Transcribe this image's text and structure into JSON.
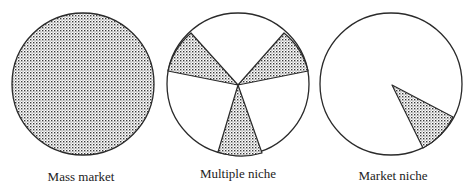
{
  "colors": {
    "outline": "#2a2a2a",
    "stipple_dot": "#3a3a3a",
    "background": "#ffffff"
  },
  "diagrams": [
    {
      "id": "mass-market",
      "label": "Mass market",
      "description": "Entire circle shaded: the whole market is targeted",
      "shaded_segments": 1,
      "fully_shaded": true
    },
    {
      "id": "multiple-niche",
      "label": "Multiple niche",
      "description": "Circle divided into three unshaded regions separated by three shaded wedges",
      "shaded_segments": 3,
      "fully_shaded": false
    },
    {
      "id": "market-niche",
      "label": "Market niche",
      "description": "Circle with a single small shaded wedge in the lower right",
      "shaded_segments": 1,
      "fully_shaded": false
    }
  ]
}
